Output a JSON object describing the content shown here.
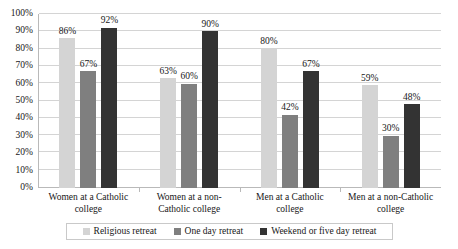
{
  "chart_data": {
    "type": "bar",
    "title": "",
    "xlabel": "",
    "ylabel": "",
    "ylim": [
      0,
      100
    ],
    "grid": true,
    "legend_position": "bottom",
    "categories": [
      "Women at a Catholic college",
      "Women at a non-Catholic college",
      "Men at a Catholic college",
      "Men at a non-Catholic college"
    ],
    "y_ticks": [
      "0%",
      "10%",
      "20%",
      "30%",
      "40%",
      "50%",
      "60%",
      "70%",
      "80%",
      "90%",
      "100%"
    ],
    "series": [
      {
        "name": "Religious retreat",
        "color": "#d4d4d4",
        "values": [
          86,
          63,
          80,
          59
        ],
        "labels": [
          "86%",
          "63%",
          "80%",
          "59%"
        ]
      },
      {
        "name": "One day retreat",
        "color": "#7f7f7f",
        "values": [
          67,
          60,
          42,
          30
        ],
        "labels": [
          "67%",
          "60%",
          "42%",
          "30%"
        ]
      },
      {
        "name": "Weekend or five day retreat",
        "color": "#333333",
        "values": [
          92,
          90,
          67,
          48
        ],
        "labels": [
          "92%",
          "90%",
          "67%",
          "48%"
        ]
      }
    ]
  }
}
